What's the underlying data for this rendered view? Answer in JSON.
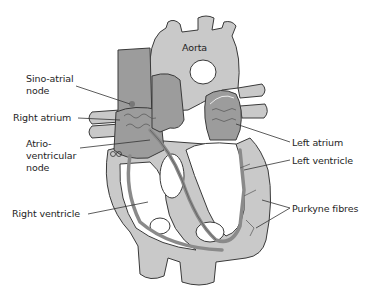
{
  "labels": {
    "aorta": "Aorta",
    "sino_atrial_1": "Sino-atrial",
    "sino_atrial_2": "node",
    "right_atrium": "Right atrium",
    "atrio_1": "Atrio-",
    "atrio_2": "ventricular",
    "atrio_3": "node",
    "right_ventricle": "Right ventricle",
    "left_atrium": "Left atrium",
    "left_ventricle": "Left ventricle",
    "purkyne": "Purkyne fibres"
  },
  "colors": {
    "tissue_light": "#c9c9c9",
    "tissue_dark": "#9c9c9c",
    "conduction": "#8a8a8a",
    "outline": "#3a3a3a",
    "cavity": "#ffffff"
  }
}
